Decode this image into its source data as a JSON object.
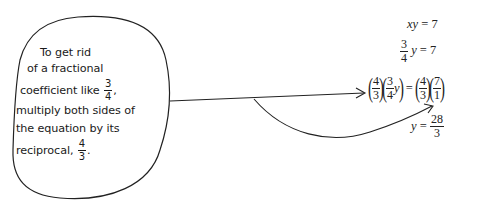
{
  "callout": {
    "lines": [
      "To get rid",
      "of a fractional",
      "coefficient like",
      "multiply both sides of",
      "the equation by its",
      "reciprocal,"
    ],
    "coefficient_fraction": {
      "numerator": "3",
      "denominator": "4"
    },
    "reciprocal_fraction": {
      "numerator": "4",
      "denominator": "3"
    },
    "comma": ",",
    "period": "."
  },
  "equations": {
    "eq1": {
      "lhs": "xy",
      "eq": "=",
      "rhs": "7"
    },
    "eq2": {
      "frac_num": "3",
      "frac_den": "4",
      "var": "y",
      "eq": "=",
      "rhs": "7"
    },
    "eq3": {
      "f1_num": "4",
      "f1_den": "3",
      "f2_num": "3",
      "f2_den": "4",
      "f2_var": "y",
      "eq": "=",
      "f3_num": "4",
      "f3_den": "3",
      "f4_num": "7",
      "f4_den": "1"
    },
    "eq4": {
      "lhs": "y",
      "eq": "=",
      "frac_num": "28",
      "frac_den": "3"
    }
  },
  "colors": {
    "ink": "#222222",
    "background": "#ffffff"
  }
}
